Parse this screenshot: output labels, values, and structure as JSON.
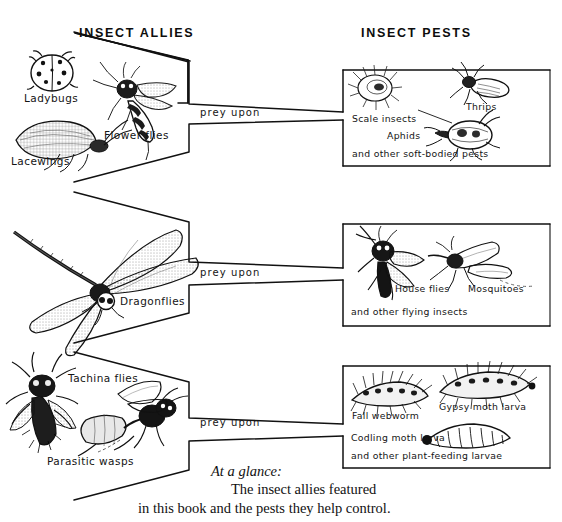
{
  "figure": {
    "type": "diagram",
    "style": "hand-drawn pen-and-ink book illustration",
    "headers": {
      "left": "INSECT ALLIES",
      "right": "INSECT PESTS"
    },
    "relation_label": "prey upon",
    "caption": {
      "line1": "At a glance:",
      "line2": "The insect allies featured",
      "line3": "in this book and the pests they help control."
    },
    "rows": [
      {
        "id": "row-1",
        "allies": {
          "labels": [
            "Ladybugs",
            "Lacewings",
            "Flower flies"
          ],
          "drawings": [
            "ladybug-drawing",
            "lacewing-drawing",
            "flower-fly-drawing"
          ]
        },
        "relation": "prey upon",
        "pests": {
          "labels": [
            "Scale insects",
            "Thrips",
            "Aphids",
            "and other soft-bodied pests"
          ],
          "drawings": [
            "scale-insect-drawing",
            "thrips-drawing",
            "aphid-drawing"
          ]
        }
      },
      {
        "id": "row-2",
        "allies": {
          "labels": [
            "Dragonflies"
          ],
          "drawings": [
            "dragonfly-drawing"
          ]
        },
        "relation": "prey upon",
        "pests": {
          "labels": [
            "House flies",
            "Mosquitoes",
            "and other flying insects"
          ],
          "drawings": [
            "house-fly-drawing",
            "mosquito-drawing"
          ]
        }
      },
      {
        "id": "row-3",
        "allies": {
          "labels": [
            "Tachina flies",
            "Parasitic wasps"
          ],
          "drawings": [
            "tachina-fly-drawing",
            "parasitic-wasp-drawing"
          ]
        },
        "relation": "prey upon",
        "pests": {
          "labels": [
            "Fall webworm",
            "Gypsy moth larva",
            "Codling moth larva",
            "and other plant-feeding larvae"
          ],
          "drawings": [
            "fall-webworm-drawing",
            "gypsy-moth-larva-drawing",
            "codling-moth-larva-drawing"
          ]
        }
      }
    ],
    "colors": {
      "ink": "#141414",
      "paper": "#ffffff"
    }
  }
}
